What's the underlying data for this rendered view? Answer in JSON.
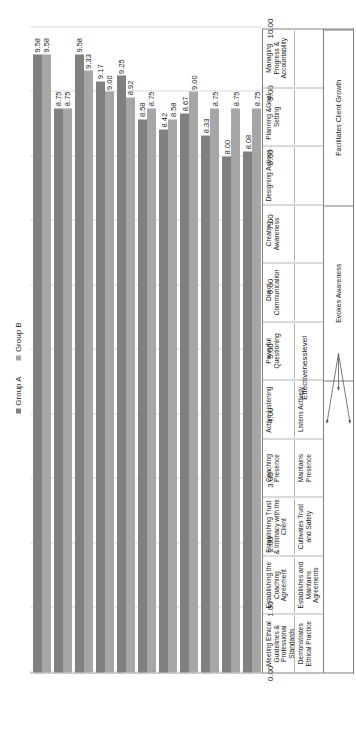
{
  "chart_data": {
    "type": "bar",
    "title": "",
    "xlabel": "",
    "ylabel": "Effectivenesslevel",
    "ylim": [
      0,
      10
    ],
    "yticks": [
      "0.00",
      "1.00",
      "2.00",
      "3.00",
      "4.00",
      "5.00",
      "6.00",
      "7.00",
      "8.00",
      "9.00",
      "10.00"
    ],
    "grid": true,
    "legend_position": "top",
    "categories": [
      "Meeting Ethical Guidelines & Professional Standards",
      "Establishing the Coaching Agreement",
      "Establishing Trust & Intimacy with the Client",
      "Coaching Presence",
      "Active Listening",
      "Powerful Questioning",
      "Direct Communication",
      "Creating Awareness",
      "Designing Actions",
      "Planning &Goal Setting",
      "Managing Progress & Accountability"
    ],
    "subcategories": [
      "Demonstrates Ethical Practice",
      "Establishes and Maintains Agreements",
      "Cultivates Trust and Safety",
      "Maintains Presence",
      "Listens Actively",
      "",
      "",
      "",
      "",
      "",
      ""
    ],
    "series": [
      {
        "name": "Group A",
        "color": "#808080",
        "values": [
          9.58,
          8.75,
          9.58,
          9.17,
          9.25,
          8.58,
          8.42,
          8.67,
          8.33,
          8.0,
          8.08
        ]
      },
      {
        "name": "Group B",
        "color": "#a6a6a6",
        "values": [
          9.58,
          8.75,
          9.33,
          9.0,
          8.92,
          8.75,
          8.58,
          9.0,
          8.75,
          8.75,
          8.75
        ]
      }
    ],
    "bands": [
      {
        "label": "",
        "span": 5
      },
      {
        "label": "Evokes Awareness",
        "span": 3
      },
      {
        "label": "Facilitates Client Growth",
        "span": 3
      }
    ],
    "annotations": [
      "Evokes Awareness",
      "Facilitates Client Growth"
    ]
  },
  "legend": {
    "items": [
      {
        "label": "Group A",
        "color": "#808080"
      },
      {
        "label": "Group B",
        "color": "#a6a6a6"
      }
    ]
  }
}
